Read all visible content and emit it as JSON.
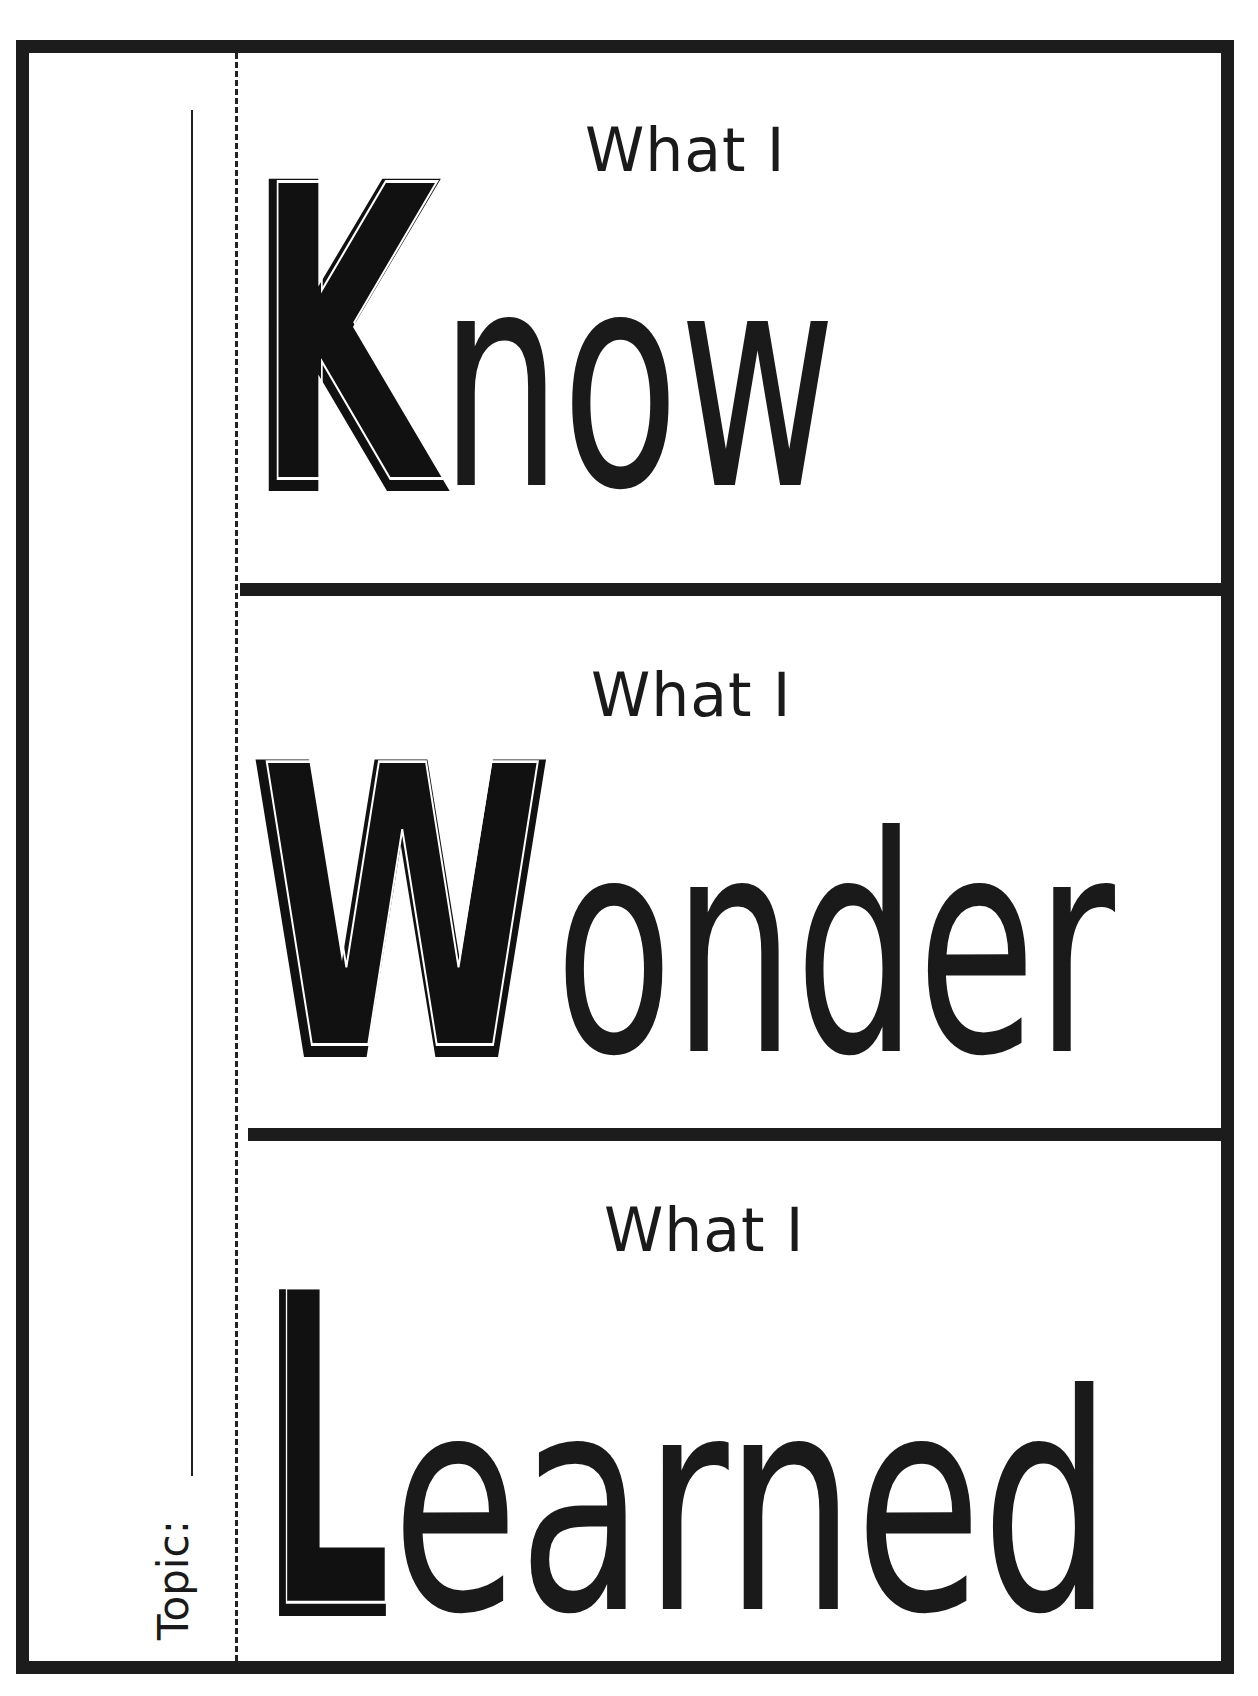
{
  "worksheet": {
    "topic": {
      "label": "Topic:",
      "value": ""
    },
    "sections": [
      {
        "id": "know",
        "prefix": "What I",
        "initial": "K",
        "rest": "now",
        "word": "Know"
      },
      {
        "id": "wonder",
        "prefix": "What I",
        "initial": "W",
        "rest": "onder",
        "word": "Wonder"
      },
      {
        "id": "learned",
        "prefix": "What I",
        "initial": "L",
        "rest": "earned",
        "word": "Learned"
      }
    ]
  },
  "colors": {
    "ink": "#1c1c1c",
    "paper": "#ffffff"
  }
}
